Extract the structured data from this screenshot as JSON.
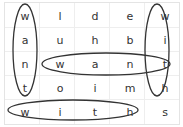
{
  "puzzle": {
    "type": "word-search",
    "grid": [
      [
        "w",
        "l",
        "d",
        "e",
        "w"
      ],
      [
        "a",
        "u",
        "h",
        "b",
        "i"
      ],
      [
        "n",
        "w",
        "a",
        "n",
        "t"
      ],
      [
        "t",
        "o",
        "i",
        "m",
        "h"
      ],
      [
        "w",
        "i",
        "t",
        "h",
        "s"
      ]
    ],
    "found_words": [
      {
        "word": "want",
        "direction": "vertical",
        "col": 0,
        "rows": [
          0,
          3
        ]
      },
      {
        "word": "with",
        "direction": "vertical",
        "col": 4,
        "rows": [
          0,
          3
        ]
      },
      {
        "word": "want",
        "direction": "horizontal",
        "row": 2,
        "cols": [
          1,
          4
        ]
      },
      {
        "word": "with",
        "direction": "horizontal",
        "row": 4,
        "cols": [
          0,
          3
        ]
      }
    ]
  }
}
